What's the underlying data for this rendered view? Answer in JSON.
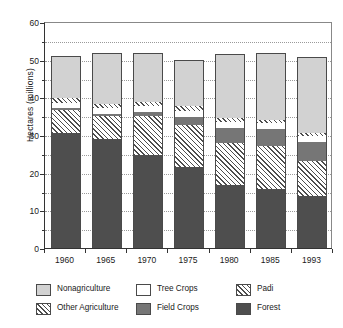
{
  "chart_data": {
    "type": "bar",
    "stacked": true,
    "title": "",
    "xlabel": "",
    "ylabel": "Hectares  (millions)",
    "ylim": [
      0,
      60
    ],
    "yticks": [
      0,
      10,
      20,
      30,
      40,
      50,
      60
    ],
    "ytick_labels": [
      "0",
      "10",
      "20",
      "30",
      "40",
      "50",
      "60"
    ],
    "minor_tick_step": 5,
    "grid": "dotted-horizontal",
    "legend_position": "below",
    "categories": [
      "1960",
      "1965",
      "1970",
      "1975",
      "1980",
      "1985",
      "1993"
    ],
    "series": [
      {
        "name": "Forest",
        "key": "forest",
        "color": "#4e4e4e",
        "pattern": "solid-dark",
        "values": [
          30.4,
          28.8,
          24.7,
          21.6,
          16.7,
          15.6,
          13.8
        ]
      },
      {
        "name": "Padi",
        "key": "padi",
        "color": "#4d4d4d",
        "pattern": "hatch-45",
        "values": [
          1.2,
          1.1,
          1.1,
          1.1,
          1.0,
          0.9,
          0.8
        ]
      },
      {
        "name": "Other Agriculture",
        "key": "otherag",
        "color": "#4d4d4d",
        "pattern": "hatch-45",
        "values": [
          6.2,
          6.2,
          10.3,
          11.0,
          11.3,
          11.4,
          9.4
        ]
      },
      {
        "name": "Field Crops",
        "key": "field",
        "color": "#767676",
        "pattern": "solid-mid",
        "values": [
          0.6,
          0.7,
          1.2,
          2.2,
          3.9,
          4.6,
          4.9
        ]
      },
      {
        "name": "Tree Crops",
        "key": "tree",
        "color": "#ffffff",
        "pattern": "solid-white",
        "values": [
          1.4,
          1.4,
          1.4,
          1.7,
          1.5,
          1.6,
          1.6
        ]
      },
      {
        "name": "Nonagriculture",
        "key": "nonag",
        "color": "#d2d2d2",
        "pattern": "solid-light",
        "values": [
          11.3,
          13.7,
          13.1,
          12.2,
          17.1,
          17.7,
          20.2
        ]
      }
    ],
    "stack_order_bottom_to_top": [
      "Forest",
      "Other Agriculture",
      "Field Crops",
      "Tree Crops",
      "Padi",
      "Nonagriculture"
    ],
    "totals": [
      51.1,
      51.9,
      51.8,
      49.8,
      51.5,
      51.8,
      50.7
    ]
  },
  "legend": {
    "items": [
      {
        "label": "Nonagriculture",
        "swatch": "nonag"
      },
      {
        "label": "Tree Crops",
        "swatch": "tree"
      },
      {
        "label": "Padi",
        "swatch": "padi"
      },
      {
        "label": "Other Agriculture",
        "swatch": "otherag"
      },
      {
        "label": "Field Crops",
        "swatch": "field"
      },
      {
        "label": "Forest",
        "swatch": "forest"
      }
    ]
  }
}
